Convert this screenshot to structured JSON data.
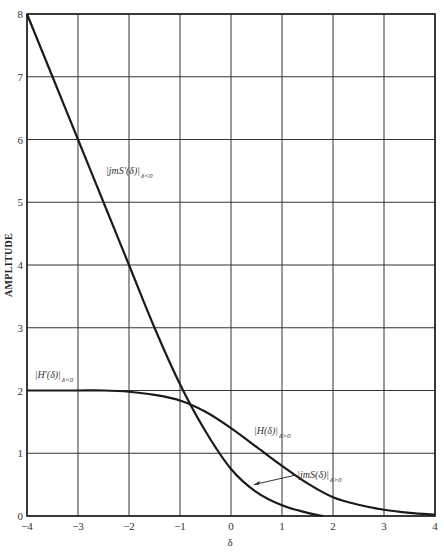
{
  "chart_data": {
    "type": "line",
    "title": "",
    "xlabel": "δ",
    "ylabel": "AMPLITUDE",
    "xlim": [
      -4,
      4
    ],
    "ylim": [
      0,
      8
    ],
    "grid": true,
    "legend": "none (inline annotations)",
    "x_ticks": [
      "−4",
      "−3",
      "−2",
      "−1",
      "0",
      "1",
      "2",
      "3",
      "4"
    ],
    "y_ticks": [
      "0",
      "1",
      "2",
      "3",
      "4",
      "5",
      "6",
      "7",
      "8"
    ],
    "series": [
      {
        "name": "|jmS'(δ)|_{δ<0}",
        "label": "|jmS′(δ)|",
        "subscript": "δ<0",
        "x": [
          -4,
          -3.5,
          -3,
          -2.5,
          -2,
          -1.5,
          -1,
          -0.5,
          0,
          0.5,
          1,
          1.5,
          1.8
        ],
        "values": [
          8.0,
          7.0,
          6.0,
          5.0,
          4.0,
          3.0,
          2.1,
          1.35,
          0.75,
          0.38,
          0.17,
          0.05,
          0.0
        ]
      },
      {
        "name": "|H'(δ)|_{δ<0}",
        "label": "|H′(δ)|",
        "subscript": "δ<0",
        "x": [
          -4,
          -3.5,
          -3,
          -2.5,
          -2,
          -1.5,
          -1,
          -0.5,
          0,
          0.5,
          1,
          1.5,
          2,
          2.5,
          3,
          3.5,
          4
        ],
        "values": [
          2.0,
          2.0,
          2.0,
          2.0,
          1.98,
          1.93,
          1.84,
          1.66,
          1.4,
          1.1,
          0.8,
          0.52,
          0.3,
          0.18,
          0.1,
          0.05,
          0.02
        ]
      }
    ],
    "annotations": [
      {
        "text": "|jmS′(δ)|",
        "sub": "δ<0",
        "at": [
          -2.45,
          5.45
        ]
      },
      {
        "text": "|H′(δ)|",
        "sub": "δ<0",
        "at": [
          -3.85,
          2.2
        ]
      },
      {
        "text": "|H(δ)|",
        "sub": "δ>0",
        "at": [
          0.45,
          1.3
        ]
      },
      {
        "text": "|jmS(δ)|",
        "sub": "δ>0",
        "at": [
          1.3,
          0.6
        ],
        "arrow_to": [
          0.45,
          0.5
        ]
      }
    ]
  }
}
